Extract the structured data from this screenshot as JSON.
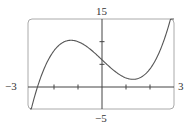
{
  "chart_data": {
    "type": "line",
    "title": "",
    "xlabel": "",
    "ylabel": "",
    "xlim": [
      -3,
      3
    ],
    "ylim": [
      -5,
      15
    ],
    "x_ticks": [
      -2,
      -1,
      0,
      1,
      2
    ],
    "y_ticks": [
      5,
      10
    ],
    "tick_labels": {
      "x_min": "−3",
      "x_max": "3",
      "y_max": "15",
      "y_min": "−5"
    },
    "grid": false,
    "legend": null,
    "series": [
      {
        "name": "f(x)",
        "x": [
          -3,
          -2.5,
          -2,
          -1.5,
          -1.29,
          -1,
          -0.5,
          0,
          0.5,
          1,
          1.29,
          1.5,
          2,
          2.5,
          2.85
        ],
        "values": [
          -6,
          3.9,
          8,
          10.1,
          10.3,
          10,
          8.4,
          6,
          3.6,
          2,
          1.7,
          2.1,
          4,
          9.1,
          15
        ]
      }
    ],
    "colors": {
      "curve": "#555555",
      "axes": "#444444",
      "frame": "#999999"
    }
  }
}
